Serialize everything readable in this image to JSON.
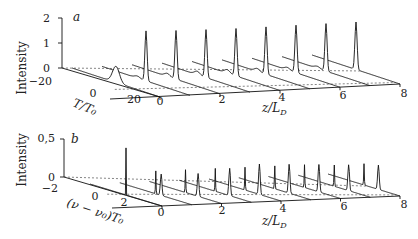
{
  "chart_data": [
    {
      "type": "waterfall-3d-line",
      "panel_label": "a",
      "ylabel": "Intensity",
      "yticks": [
        "0",
        "1",
        "2"
      ],
      "ylim": [
        0,
        2
      ],
      "xlabel": "T/T0",
      "xlabel_display": "T/T₀",
      "xticks": [
        "−20",
        "0",
        "20"
      ],
      "xlim": [
        -20,
        20
      ],
      "zlabel": "z/L_D",
      "zticks": [
        "0",
        "2",
        "4",
        "6",
        "8"
      ],
      "zlim": [
        0,
        8
      ],
      "series": [
        {
          "z": 0,
          "peak": 0.65,
          "width": 2.2,
          "side_bumps": []
        },
        {
          "z": 1,
          "peak": 2.0,
          "width": 0.7,
          "side_bumps": [
            {
              "pos": -4,
              "amp": 0.08
            }
          ]
        },
        {
          "z": 2,
          "peak": 1.95,
          "width": 0.7,
          "side_bumps": [
            {
              "pos": -4,
              "amp": 0.12
            }
          ]
        },
        {
          "z": 3,
          "peak": 1.92,
          "width": 0.7,
          "side_bumps": [
            {
              "pos": -4,
              "amp": 0.14
            }
          ]
        },
        {
          "z": 4,
          "peak": 1.9,
          "width": 0.7,
          "side_bumps": [
            {
              "pos": -4,
              "amp": 0.14
            }
          ]
        },
        {
          "z": 5,
          "peak": 1.9,
          "width": 0.7,
          "side_bumps": [
            {
              "pos": -4,
              "amp": 0.12
            }
          ]
        },
        {
          "z": 6,
          "peak": 1.9,
          "width": 0.7,
          "side_bumps": [
            {
              "pos": -4,
              "amp": 0.1
            }
          ]
        },
        {
          "z": 7,
          "peak": 1.9,
          "width": 0.7,
          "side_bumps": [
            {
              "pos": -4,
              "amp": 0.08
            }
          ]
        },
        {
          "z": 8,
          "peak": 1.9,
          "width": 0.7,
          "side_bumps": []
        }
      ]
    },
    {
      "type": "waterfall-3d-line",
      "panel_label": "b",
      "ylabel": "Intensity",
      "yticks": [
        "0",
        "0,5"
      ],
      "ylim": [
        0,
        0.5
      ],
      "xlabel": "(ν−ν0)T0",
      "xlabel_display": "(ν − ν₀)T₀",
      "xticks": [
        "−2",
        "0",
        "2"
      ],
      "xlim": [
        -2,
        2
      ],
      "zlabel": "z/L_D",
      "zticks": [
        "0",
        "2",
        "4",
        "6",
        "8"
      ],
      "zlim": [
        0,
        8
      ],
      "series": [
        {
          "z": 0,
          "peak": 0.62,
          "width": 0.12,
          "side_bumps": []
        },
        {
          "z": 1,
          "peak": 0.3,
          "width": 0.25,
          "side_bumps": [
            {
              "pos": 0.3,
              "amp": 0.28
            }
          ]
        },
        {
          "z": 2,
          "peak": 0.3,
          "width": 0.25,
          "side_bumps": [
            {
              "pos": 0.7,
              "amp": 0.3
            }
          ]
        },
        {
          "z": 3,
          "peak": 0.3,
          "width": 0.25,
          "side_bumps": [
            {
              "pos": 0.8,
              "amp": 0.36
            }
          ]
        },
        {
          "z": 4,
          "peak": 0.3,
          "width": 0.25,
          "side_bumps": [
            {
              "pos": 0.8,
              "amp": 0.4
            }
          ]
        },
        {
          "z": 5,
          "peak": 0.3,
          "width": 0.25,
          "side_bumps": [
            {
              "pos": 0.8,
              "amp": 0.38
            }
          ]
        },
        {
          "z": 6,
          "peak": 0.3,
          "width": 0.25,
          "side_bumps": [
            {
              "pos": 0.8,
              "amp": 0.36
            }
          ]
        },
        {
          "z": 7,
          "peak": 0.28,
          "width": 0.25,
          "side_bumps": [
            {
              "pos": 0.8,
              "amp": 0.34
            }
          ]
        },
        {
          "z": 8,
          "peak": 0.28,
          "width": 0.25,
          "side_bumps": [
            {
              "pos": 0.8,
              "amp": 0.32
            }
          ]
        }
      ]
    }
  ]
}
